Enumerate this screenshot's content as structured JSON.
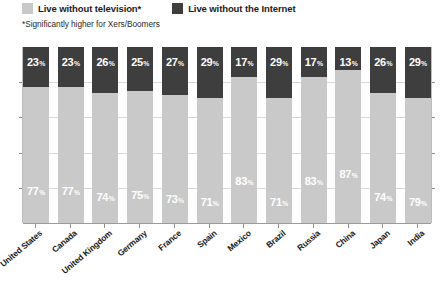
{
  "legend": {
    "items": [
      {
        "label": "Live without television*",
        "color": "#c9c9c9",
        "key": "television"
      },
      {
        "label": "Live without the Internet",
        "color": "#3e3e3e",
        "key": "internet"
      }
    ]
  },
  "footnote": "*Significantly higher for Xers/Boomers",
  "source": "",
  "percent_symbol": "%",
  "chart_data": {
    "type": "bar",
    "subtype": "stacked-100-percent",
    "title": "",
    "subtitle": "*Significantly higher for Xers/Boomers",
    "xlabel": "",
    "ylabel": "",
    "ylim": [
      0,
      100
    ],
    "grid": true,
    "gridlines": [
      20,
      40,
      60,
      80
    ],
    "legend_position": "top-left",
    "stack_order": [
      "television",
      "internet"
    ],
    "categories": [
      "United States",
      "Canada",
      "United Kingdom",
      "Germany",
      "France",
      "Spain",
      "Mexico",
      "Brazil",
      "Russia",
      "China",
      "Japan",
      "India"
    ],
    "series": [
      {
        "name": "Live without the Internet",
        "key": "internet",
        "color": "#3e3e3e",
        "values": [
          23,
          23,
          26,
          25,
          27,
          29,
          17,
          29,
          17,
          13,
          26,
          29
        ],
        "labels": [
          "23",
          "23",
          "26",
          "25",
          "27",
          "29",
          "17",
          "29",
          "17",
          "13",
          "26",
          "29"
        ]
      },
      {
        "name": "Live without television*",
        "key": "television",
        "color": "#c9c9c9",
        "values": [
          77,
          77,
          74,
          75,
          73,
          71,
          83,
          71,
          83,
          87,
          74,
          79
        ],
        "labels": [
          "77",
          "77",
          "74",
          "75",
          "73",
          "71",
          "83",
          "71",
          "83",
          "87",
          "74",
          "79"
        ]
      }
    ]
  }
}
